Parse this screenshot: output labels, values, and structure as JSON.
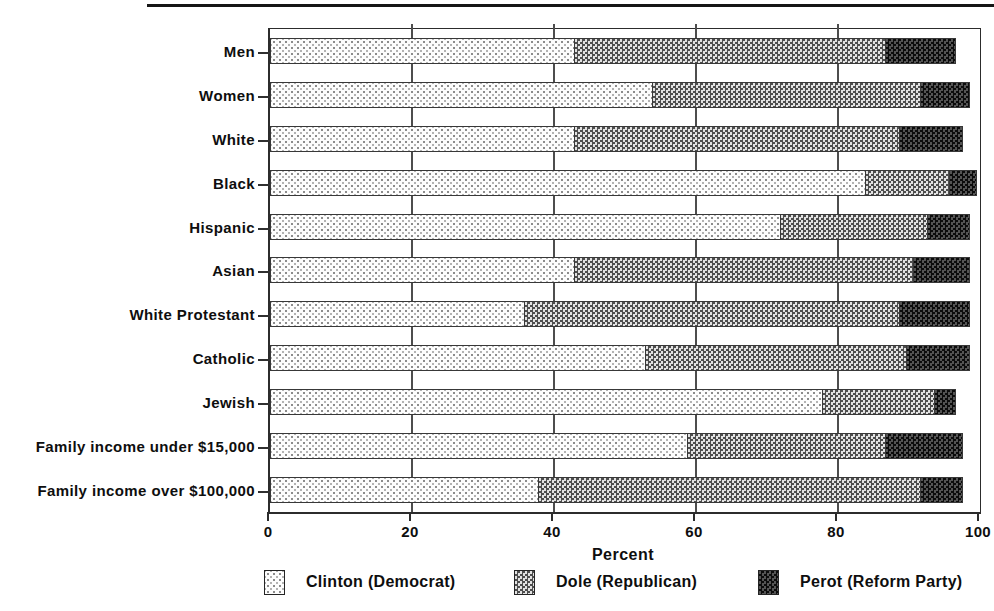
{
  "page": {
    "background": "#ffffff",
    "top_rule_color": "#161616"
  },
  "chart_data": {
    "type": "bar",
    "orientation": "horizontal-stacked",
    "title": "",
    "xlabel": "Percent",
    "ylabel": "",
    "xlim": [
      0,
      100
    ],
    "xticks": [
      0,
      20,
      40,
      60,
      80,
      100
    ],
    "grid": "vertical gridlines at x ticks",
    "legend_position": "bottom",
    "categories": [
      "Men",
      "Women",
      "White",
      "Black",
      "Hispanic",
      "Asian",
      "White Protestant",
      "Catholic",
      "Jewish",
      "Family income under $15,000",
      "Family income over $100,000"
    ],
    "series": [
      {
        "key": "clinton",
        "name": "Clinton (Democrat)",
        "pattern": "light-dot-stipple",
        "values": [
          43,
          54,
          43,
          84,
          72,
          43,
          36,
          53,
          78,
          59,
          38
        ]
      },
      {
        "key": "dole",
        "name": "Dole (Republican)",
        "pattern": "medium-gray-checker",
        "values": [
          44,
          38,
          46,
          12,
          21,
          48,
          53,
          37,
          16,
          28,
          54
        ]
      },
      {
        "key": "perot",
        "name": "Perot (Reform Party)",
        "pattern": "dark-checker",
        "values": [
          10,
          7,
          9,
          4,
          6,
          8,
          10,
          9,
          3,
          11,
          6
        ]
      }
    ],
    "colors": {
      "clinton_dot": "#8c8c8c",
      "clinton_bg": "#fdfdfd",
      "dole_dark": "#4e4e4e",
      "dole_light": "#e2e2e2",
      "perot_dark": "#0c0c0c",
      "perot_light": "#545454",
      "axis": "#2c2c2c",
      "grid": "#4d4d4d",
      "text": "#0e0e0e"
    }
  }
}
